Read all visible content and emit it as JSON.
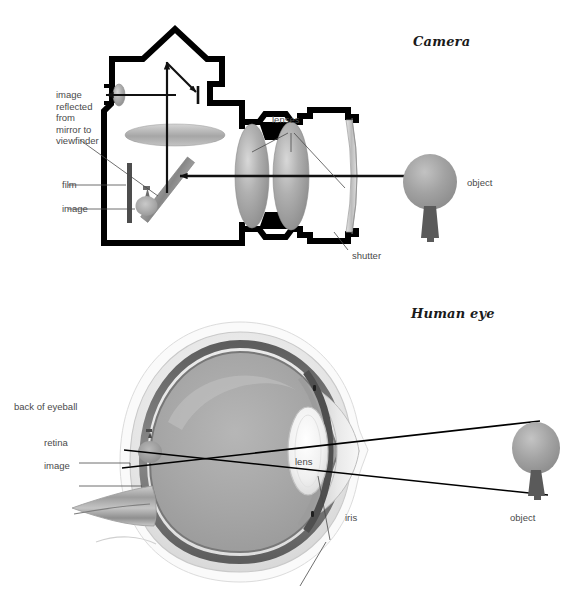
{
  "page": {
    "width": 584,
    "height": 603,
    "background": "#ffffff",
    "ink": "#000000",
    "label_color": "#4a4a4a"
  },
  "figures": [
    {
      "id": "camera",
      "title": "Camera",
      "labels": {
        "image_reflected": "image\nreflected\nfrom\nmirror to\nviewfinder",
        "image_reflected_lines": [
          "image",
          "reflected",
          "from",
          "mirror to",
          "viewfinder"
        ],
        "film": "film",
        "image": "image",
        "lenses": "lenses",
        "shutter": "shutter",
        "object": "object"
      }
    },
    {
      "id": "human-eye",
      "title": "Human eye",
      "labels": {
        "back_of_eyeball": "back of eyeball",
        "retina": "retina",
        "image": "image",
        "lens": "lens",
        "iris": "iris",
        "object": "object"
      }
    }
  ],
  "colors": {
    "body_outline": "#000000",
    "lens_glass": "#9a9a9a",
    "lens_glass_light": "#c9c9c9",
    "mirror": "#8c8c8c",
    "film": "#4d4d4d",
    "tree_canopy": "#9d9d9d",
    "tree_trunk": "#5a5a5a",
    "sclera": "#e8e8e8",
    "choroid": "#6f6f6f",
    "vitreous": "#a8a8a8",
    "eye_lens": "#f2f2f2",
    "iris_band": "#585858",
    "optic_nerve": "#b5b5b5",
    "ray_line": "#000000"
  }
}
